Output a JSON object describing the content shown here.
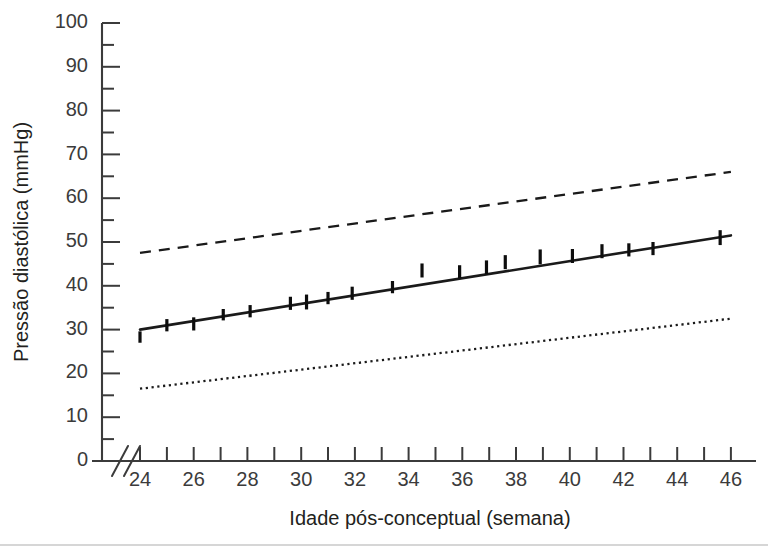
{
  "figure": {
    "background_color": "#ffffff",
    "ink_color": "#231f20",
    "line_color": "#1a1a1a"
  },
  "chart_data": {
    "type": "line",
    "title": "",
    "subtitle": "",
    "xlabel": "Idade pós-conceptual (semana)",
    "ylabel": "Pressão diastólica (mmHg)",
    "xlim": [
      24,
      46
    ],
    "ylim": [
      0,
      100
    ],
    "grid": false,
    "legend_position": "none",
    "axis_break_x": true,
    "axis_break_note": "//",
    "xticks": [
      24,
      25,
      26,
      27,
      28,
      29,
      30,
      31,
      32,
      33,
      34,
      35,
      36,
      37,
      38,
      39,
      40,
      41,
      42,
      43,
      44,
      45,
      46
    ],
    "xtick_labels": [
      "24",
      "",
      "26",
      "",
      "28",
      "",
      "30",
      "",
      "32",
      "",
      "34",
      "",
      "36",
      "",
      "38",
      "",
      "40",
      "",
      "42",
      "",
      "44",
      "",
      "46"
    ],
    "yticks": [
      0,
      5,
      10,
      15,
      20,
      25,
      30,
      35,
      40,
      45,
      50,
      55,
      60,
      65,
      70,
      75,
      80,
      85,
      90,
      95,
      100
    ],
    "ytick_labels": [
      "0",
      "",
      "10",
      "",
      "20",
      "",
      "30",
      "",
      "40",
      "",
      "50",
      "",
      "60",
      "",
      "70",
      "",
      "80",
      "",
      "90",
      "",
      "100"
    ],
    "series": [
      {
        "name": "Limite superior (percentil alto)",
        "style": "dashed",
        "x": [
          24,
          46
        ],
        "values": [
          47.5,
          66.0
        ]
      },
      {
        "name": "Média (regressão linear)",
        "style": "solid",
        "x": [
          24,
          46
        ],
        "values": [
          30.0,
          51.5
        ]
      },
      {
        "name": "Limite inferior (percentil baixo)",
        "style": "dotted",
        "x": [
          24,
          46
        ],
        "values": [
          16.5,
          32.5
        ]
      }
    ],
    "markers": {
      "name": "Pressão diastólica observada (média ± desvio)",
      "style": "vertical-bar",
      "points": [
        {
          "x": 24.0,
          "y": 28.3,
          "half": 1.3
        },
        {
          "x": 25.0,
          "y": 31.0,
          "half": 1.4
        },
        {
          "x": 26.0,
          "y": 31.3,
          "half": 1.5
        },
        {
          "x": 27.1,
          "y": 33.4,
          "half": 1.3
        },
        {
          "x": 28.1,
          "y": 34.2,
          "half": 1.4
        },
        {
          "x": 29.6,
          "y": 36.0,
          "half": 1.5
        },
        {
          "x": 30.2,
          "y": 36.3,
          "half": 1.7
        },
        {
          "x": 31.0,
          "y": 37.2,
          "half": 1.4
        },
        {
          "x": 31.9,
          "y": 38.3,
          "half": 1.5
        },
        {
          "x": 33.4,
          "y": 39.7,
          "half": 1.4
        },
        {
          "x": 34.5,
          "y": 43.5,
          "half": 1.6
        },
        {
          "x": 35.9,
          "y": 43.2,
          "half": 1.5
        },
        {
          "x": 36.9,
          "y": 44.2,
          "half": 1.6
        },
        {
          "x": 37.6,
          "y": 45.4,
          "half": 1.6
        },
        {
          "x": 38.9,
          "y": 46.6,
          "half": 1.7
        },
        {
          "x": 40.1,
          "y": 46.8,
          "half": 1.6
        },
        {
          "x": 41.2,
          "y": 47.9,
          "half": 1.6
        },
        {
          "x": 42.2,
          "y": 48.2,
          "half": 1.5
        },
        {
          "x": 43.1,
          "y": 48.5,
          "half": 1.5
        },
        {
          "x": 45.6,
          "y": 51.0,
          "half": 1.7
        }
      ]
    }
  }
}
